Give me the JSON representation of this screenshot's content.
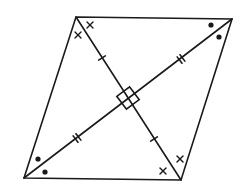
{
  "diagram": {
    "type": "rhombus-with-diagonals",
    "stroke_color": "#1a1a1a",
    "background": "#ffffff",
    "vertices": {
      "top_left": [
        76,
        17
      ],
      "top_right": [
        232,
        19
      ],
      "bottom_right": [
        181,
        180
      ],
      "bottom_left": [
        24,
        178
      ]
    },
    "center": [
      128,
      98
    ],
    "markings": {
      "right_angle": "square at diagonal intersection",
      "diagonal_tl_br_ticks": "single tick on each half",
      "diagonal_bl_tr_ticks": "double tick on each half",
      "angle_marks_tl": "x (two angle marks)",
      "angle_marks_br": "x (two angle marks)",
      "angle_marks_tr": "dot (two angle marks)",
      "angle_marks_bl": "dot (two angle marks)"
    }
  }
}
